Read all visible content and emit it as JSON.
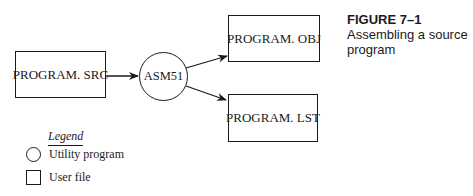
{
  "figure": {
    "number": "FIGURE 7–1",
    "title_line1": "Assembling a source",
    "title_line2": "program"
  },
  "nodes": {
    "source_file": {
      "label": "PROGRAM. SRC",
      "type": "user-file"
    },
    "assembler": {
      "label": "ASM51",
      "type": "utility-program"
    },
    "object_file": {
      "label": "PROGRAM. OBJ",
      "type": "user-file"
    },
    "listing_file": {
      "label": "PROGRAM. LST",
      "type": "user-file"
    }
  },
  "edges": [
    {
      "from": "PROGRAM. SRC",
      "to": "ASM51"
    },
    {
      "from": "ASM51",
      "to": "PROGRAM. OBJ"
    },
    {
      "from": "ASM51",
      "to": "PROGRAM. LST"
    }
  ],
  "legend": {
    "title": "Legend",
    "items": [
      {
        "shape": "circle",
        "label": "Utility program"
      },
      {
        "shape": "square",
        "label": "User file"
      }
    ]
  }
}
